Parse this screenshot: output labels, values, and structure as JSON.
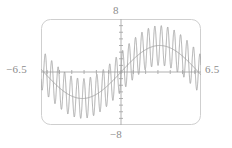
{
  "plot": {
    "frame": {
      "x": 41,
      "y": 19,
      "width": 160,
      "height": 106,
      "corner_radius": 9,
      "color": "#cfcfcf"
    },
    "axes": {
      "x_axis_y": 72,
      "y_axis_x": 121,
      "color": "#a8a8a8",
      "tick_spacing_px": 12,
      "tick_len_px": 4
    }
  },
  "labels": {
    "ymax": "8",
    "ymin": "−8",
    "xmin": "−6.5",
    "xmax": "6.5"
  },
  "chart_data": {
    "type": "line",
    "title": "",
    "xlabel": "",
    "ylabel": "",
    "xlim": [
      -6.5,
      6.5
    ],
    "ylim": [
      -8,
      8
    ],
    "grid": false,
    "legend": null,
    "axis_labels_shown": [
      "8",
      "-8",
      "-6.5",
      "6.5"
    ],
    "x_tick_interval": 1,
    "y_tick_interval": 1,
    "line_color": "#a0a0a0",
    "series": [
      {
        "name": "smooth carrier",
        "description": "low-frequency sinusoid rising left-to-right",
        "expression": "y = 4*sin(x/2) ",
        "x": [
          -6.5,
          -6.0,
          -5.5,
          -5.0,
          -4.5,
          -4.0,
          -3.5,
          -3.0,
          -2.5,
          -2.0,
          -1.5,
          -1.0,
          -0.5,
          0.0,
          0.5,
          1.0,
          1.5,
          2.0,
          2.5,
          3.0,
          3.5,
          4.0,
          4.5,
          5.0,
          5.5,
          6.0,
          6.5
        ],
        "y": [
          -0.9,
          -1.9,
          -2.8,
          -3.6,
          -4.2,
          -4.7,
          -4.9,
          -5.0,
          -4.8,
          -4.3,
          -3.5,
          -2.5,
          -1.3,
          0.0,
          1.3,
          2.5,
          3.5,
          4.3,
          4.8,
          5.0,
          4.9,
          4.7,
          4.2,
          3.6,
          2.8,
          1.9,
          0.9
        ]
      },
      {
        "name": "high-frequency overlay",
        "description": "rapid oscillation producing repeated figure-eight lobes along the carrier",
        "expression": "y = 4*sin(x/2) + 3*sin(12*x)",
        "lobe_centers_x": [
          -5.4,
          -4.0,
          -2.6,
          -1.2,
          0.2,
          1.6,
          3.0,
          4.4,
          5.6
        ],
        "lobe_amplitude": 3.0
      }
    ]
  }
}
